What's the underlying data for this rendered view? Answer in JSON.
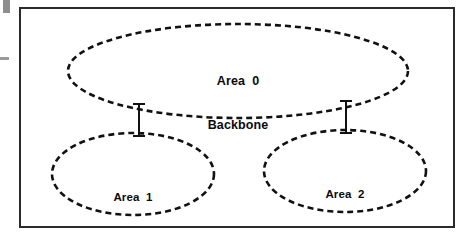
{
  "figure": {
    "background_color": "#ffffff",
    "line_color": "#111111",
    "border": {
      "name": "figure-border",
      "style": "solid",
      "color": "#2b2b2b",
      "width_px": 2,
      "x": 19,
      "y": 7,
      "width": 436,
      "height": 221
    },
    "artifacts": [
      {
        "name": "scan-artifact-block",
        "color": "#8e8e8e",
        "x": 3,
        "y": 0,
        "width": 7,
        "height": 13
      },
      {
        "name": "scan-artifact-dash",
        "color": "#9a9a9a",
        "x": 0,
        "y": 57,
        "width": 9,
        "height": 3
      }
    ]
  },
  "nodes": [
    {
      "id": "area0",
      "name": "area-0-backbone-ellipse",
      "shape": "ellipse",
      "stroke_style": "dashed",
      "stroke_color": "#111111",
      "stroke_width": 2.6,
      "dash_pattern": "6 4",
      "fill": "none",
      "cx": 238,
      "cy": 71,
      "rx": 170,
      "ry": 47,
      "label_lines": [
        "Area  0",
        "Backbone"
      ]
    },
    {
      "id": "area1",
      "name": "area-1-ellipse",
      "shape": "ellipse",
      "stroke_style": "dashed",
      "stroke_color": "#111111",
      "stroke_width": 2.6,
      "dash_pattern": "6 4",
      "fill": "none",
      "cx": 133,
      "cy": 174,
      "rx": 81,
      "ry": 41,
      "label_lines": [
        "Area  1"
      ]
    },
    {
      "id": "area2",
      "name": "area-2-ellipse",
      "shape": "ellipse",
      "stroke_style": "dashed",
      "stroke_color": "#111111",
      "stroke_width": 2.6,
      "dash_pattern": "6 4",
      "fill": "none",
      "cx": 345,
      "cy": 171,
      "rx": 81,
      "ry": 41,
      "label_lines": [
        "Area  2"
      ]
    }
  ],
  "labels": {
    "area0": {
      "name": "area-0-label",
      "line1": "Area  0",
      "line2": "Backbone"
    },
    "area1": {
      "name": "area-1-label",
      "line1": "Area  1"
    },
    "area2": {
      "name": "area-2-label",
      "line1": "Area  2"
    }
  },
  "connectors": [
    {
      "id": "link-area0-area1",
      "name": "connector-area0-area1",
      "from": "area0",
      "to": "area1",
      "style": "solid",
      "color": "#111111",
      "width": 2,
      "x": 139,
      "y_top": 104,
      "y_bottom": 136,
      "cap_half_width": 6
    },
    {
      "id": "link-area0-area2",
      "name": "connector-area0-area2",
      "from": "area0",
      "to": "area2",
      "style": "solid",
      "color": "#111111",
      "width": 2,
      "x": 346,
      "y_top": 101,
      "y_bottom": 133,
      "cap_half_width": 6
    }
  ]
}
